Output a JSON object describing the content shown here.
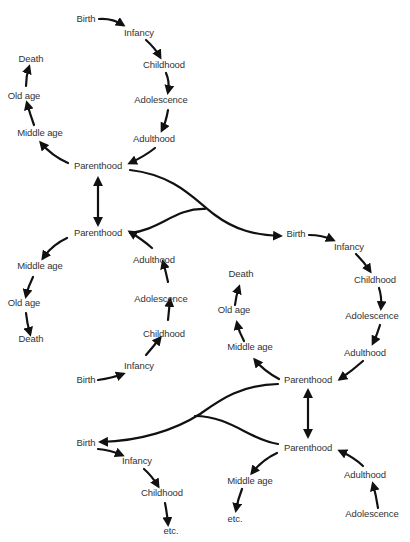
{
  "diagram": {
    "title": "",
    "type": "life-cycle-generations",
    "colors": {
      "line": "#111111",
      "text": "#333333",
      "background": "#ffffff"
    },
    "cycles": [
      {
        "id": "generation-1",
        "nodes": {
          "birth": "Birth",
          "infancy": "Infancy",
          "childhood": "Childhood",
          "adolescence": "Adolescence",
          "adulthood": "Adulthood",
          "parenthood": "Parenthood",
          "middle_age": "Middle age",
          "old_age": "Old age",
          "death": "Death"
        }
      },
      {
        "id": "generation-2",
        "nodes": {
          "birth": "Birth",
          "infancy": "Infancy",
          "childhood": "Childhood",
          "adolescence": "Adolescence",
          "adulthood": "Adulthood",
          "parenthood": "Parenthood",
          "middle_age": "Middle age",
          "old_age": "Old age",
          "death": "Death"
        }
      },
      {
        "id": "generation-3",
        "nodes": {
          "birth": "Birth",
          "infancy": "Infancy",
          "childhood": "Childhood",
          "adolescence": "Adolescence",
          "adulthood": "Adulthood",
          "parenthood": "Parenthood",
          "middle_age": "Middle age",
          "old_age": "Old age",
          "death": "Death"
        }
      },
      {
        "id": "generation-4",
        "nodes": {
          "parenthood": "Parenthood",
          "adulthood": "Adulthood",
          "adolescence": "Adolescence",
          "middle_age": "Middle age",
          "etc": "etc."
        }
      },
      {
        "id": "generation-5",
        "nodes": {
          "birth": "Birth",
          "infancy": "Infancy",
          "childhood": "Childhood",
          "etc": "etc."
        }
      }
    ]
  }
}
